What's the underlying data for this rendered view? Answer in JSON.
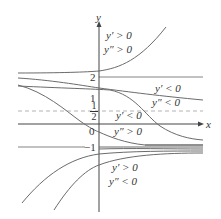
{
  "figure": {
    "type": "solution-curves-diagram",
    "axes": {
      "x_label": "x",
      "y_label": "y"
    },
    "tick_labels": {
      "two": "2",
      "half_num": "1",
      "half_den": "2",
      "zero": "0",
      "one": "1",
      "minus_one": "−1"
    },
    "reference_lines": [
      {
        "name": "y=2",
        "style": "solid"
      },
      {
        "name": "y=1/2",
        "style": "dashed"
      },
      {
        "name": "y=-1",
        "style": "solid"
      }
    ],
    "regions": [
      {
        "name": "above-2",
        "line1": "y′ > 0",
        "line2": "y″ > 0"
      },
      {
        "name": "between-half-and-2",
        "line1": "y′ < 0",
        "line2": "y″ < 0"
      },
      {
        "name": "between-minus1-and-half",
        "line1": "y′ < 0",
        "line2": "y″ > 0"
      },
      {
        "name": "below-minus1",
        "line1": "y′ > 0",
        "line2": "y″ < 0"
      }
    ],
    "colors": {
      "curve": "#6b6b6b",
      "axis": "#444444",
      "dashed": "#aaaaaa",
      "text": "#333333"
    }
  }
}
